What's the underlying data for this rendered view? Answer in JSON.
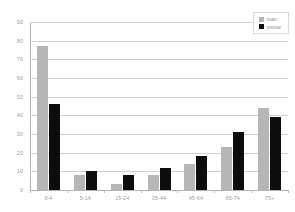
{
  "chart_data": {
    "type": "bar",
    "title": "",
    "xlabel": "",
    "ylabel": "",
    "ylim": [
      0,
      90
    ],
    "ytick_step": 10,
    "yticks": [
      0,
      10,
      20,
      30,
      40,
      50,
      60,
      70,
      80,
      90
    ],
    "ytick_labels": [
      "0",
      "10",
      "20",
      "30",
      "40",
      "50",
      "60",
      "70",
      "80",
      "90"
    ],
    "grid": true,
    "legend_position": "top-right",
    "categories": [
      "0-4",
      "5-14",
      "15-24",
      "35-44",
      "45-64",
      "65-74",
      "75+"
    ],
    "series": [
      {
        "name": "man",
        "color": "#b6b6b6",
        "values": [
          77,
          8,
          3,
          8,
          14,
          23,
          44
        ]
      },
      {
        "name": "vrouw",
        "color": "#0d0d0d",
        "values": [
          46,
          10,
          8,
          12,
          18,
          31,
          39
        ]
      }
    ]
  },
  "legend": {
    "items": [
      {
        "label": "man",
        "swatch": "man"
      },
      {
        "label": "vrouw",
        "swatch": "vrouw"
      }
    ]
  },
  "colors": {
    "man": "#b6b6b6",
    "vrouw": "#0d0d0d",
    "gridline": "#cfcfcf",
    "axis": "#b3b3b3",
    "tick_text": "#9a9a9a",
    "background": "#ffffff"
  }
}
